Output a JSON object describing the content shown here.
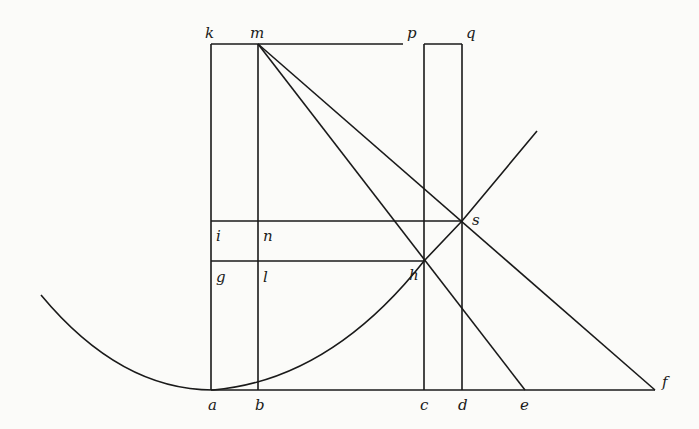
{
  "figure": {
    "points": {
      "k": "k",
      "m": "m",
      "p": "p",
      "q": "q",
      "i": "i",
      "n": "n",
      "s": "s",
      "g": "g",
      "l": "l",
      "h": "h",
      "a": "a",
      "b": "b",
      "c": "c",
      "d": "d",
      "e": "e",
      "f": "f"
    }
  }
}
